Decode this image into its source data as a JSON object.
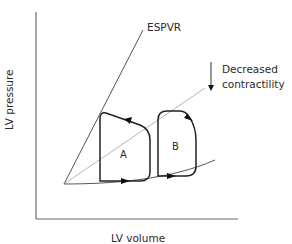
{
  "diagram": {
    "type": "pressure-volume loop",
    "axes": {
      "x_label": "LV volume",
      "y_label": "LV pressure"
    },
    "lines": {
      "espvr_label": "ESPVR",
      "shifted_espvr_label": "",
      "edpvr_label": ""
    },
    "annotation": {
      "line1": "Decreased",
      "line2": "contractility",
      "arrow_direction": "down"
    },
    "loops": [
      {
        "label": "A"
      },
      {
        "label": "B"
      }
    ],
    "colors": {
      "axis": "#555555",
      "espvr": "#555555",
      "shifted_espvr": "#b5b5b5",
      "loop": "#222222",
      "text": "#2a2a2a"
    }
  }
}
